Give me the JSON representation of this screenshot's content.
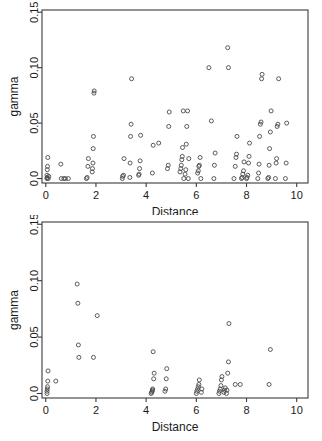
{
  "figure": {
    "title": "",
    "background": "#ffffff",
    "point_color": "#4a4a4a",
    "axis_color": "#3b3b3b"
  },
  "chart_data": [
    {
      "type": "scatter",
      "panel": "top",
      "title": "",
      "xlabel": "Distance",
      "ylabel": "gamma",
      "xlim": [
        -0.15,
        10.45
      ],
      "ylim": [
        -0.004,
        0.152
      ],
      "xticks": [
        0,
        2,
        4,
        6,
        8,
        10
      ],
      "xtick_labels": [
        "0",
        "2",
        "4",
        "6",
        "8",
        "10"
      ],
      "yticks": [
        0.0,
        0.05,
        0.1,
        0.15
      ],
      "ytick_labels": [
        "0.0",
        "0.05",
        "0.10",
        "0.15"
      ],
      "grid": false,
      "legend": null,
      "marker": "open-circle",
      "points": [
        [
          0.05,
          0.0
        ],
        [
          0.05,
          0.001
        ],
        [
          0.05,
          0.003
        ],
        [
          0.06,
          0.008
        ],
        [
          0.07,
          0.011
        ],
        [
          0.08,
          0.019
        ],
        [
          0.1,
          0.0
        ],
        [
          0.12,
          0.002
        ],
        [
          0.6,
          0.013
        ],
        [
          0.62,
          0.0
        ],
        [
          0.72,
          0.0
        ],
        [
          0.78,
          0.0
        ],
        [
          0.9,
          0.0
        ],
        [
          1.62,
          0.0
        ],
        [
          1.65,
          0.001
        ],
        [
          1.68,
          0.011
        ],
        [
          1.7,
          0.018
        ],
        [
          1.85,
          0.006
        ],
        [
          1.86,
          0.009
        ],
        [
          1.88,
          0.014
        ],
        [
          1.89,
          0.027
        ],
        [
          1.9,
          0.038
        ],
        [
          1.92,
          0.077
        ],
        [
          1.93,
          0.079
        ],
        [
          3.05,
          0.0
        ],
        [
          3.06,
          0.002
        ],
        [
          3.1,
          0.003
        ],
        [
          3.12,
          0.018
        ],
        [
          3.35,
          0.001
        ],
        [
          3.36,
          0.014
        ],
        [
          3.38,
          0.038
        ],
        [
          3.4,
          0.049
        ],
        [
          3.42,
          0.09
        ],
        [
          3.7,
          0.003
        ],
        [
          3.72,
          0.004
        ],
        [
          3.74,
          0.009
        ],
        [
          3.76,
          0.016
        ],
        [
          3.78,
          0.039
        ],
        [
          4.25,
          0.005
        ],
        [
          4.28,
          0.03
        ],
        [
          4.5,
          0.032
        ],
        [
          4.85,
          0.009
        ],
        [
          4.88,
          0.012
        ],
        [
          4.9,
          0.047
        ],
        [
          4.92,
          0.06
        ],
        [
          5.35,
          0.006
        ],
        [
          5.38,
          0.009
        ],
        [
          5.4,
          0.012
        ],
        [
          5.42,
          0.017
        ],
        [
          5.44,
          0.02
        ],
        [
          5.45,
          0.028
        ],
        [
          5.48,
          0.061
        ],
        [
          5.5,
          0.0
        ],
        [
          5.55,
          0.004
        ],
        [
          5.58,
          0.008
        ],
        [
          5.6,
          0.031
        ],
        [
          5.62,
          0.047
        ],
        [
          5.65,
          0.061
        ],
        [
          5.68,
          0.0
        ],
        [
          5.7,
          0.018
        ],
        [
          6.05,
          0.005
        ],
        [
          6.08,
          0.007
        ],
        [
          6.1,
          0.011
        ],
        [
          6.12,
          0.012
        ],
        [
          6.15,
          0.019
        ],
        [
          6.18,
          0.0
        ],
        [
          6.5,
          0.1
        ],
        [
          6.6,
          0.052
        ],
        [
          6.7,
          0.0
        ],
        [
          6.72,
          0.012
        ],
        [
          6.75,
          0.023
        ],
        [
          7.25,
          0.118
        ],
        [
          7.28,
          0.1
        ],
        [
          7.5,
          0.0
        ],
        [
          7.55,
          0.011
        ],
        [
          7.58,
          0.019
        ],
        [
          7.6,
          0.022
        ],
        [
          7.62,
          0.038
        ],
        [
          7.8,
          0.0
        ],
        [
          7.82,
          0.001
        ],
        [
          7.85,
          0.004
        ],
        [
          7.88,
          0.007
        ],
        [
          7.9,
          0.015
        ],
        [
          8.0,
          0.0
        ],
        [
          8.02,
          0.001
        ],
        [
          8.05,
          0.003
        ],
        [
          8.08,
          0.014
        ],
        [
          8.1,
          0.02
        ],
        [
          8.12,
          0.032
        ],
        [
          8.45,
          0.0
        ],
        [
          8.48,
          0.005
        ],
        [
          8.5,
          0.013
        ],
        [
          8.52,
          0.038
        ],
        [
          8.55,
          0.049
        ],
        [
          8.58,
          0.051
        ],
        [
          8.6,
          0.09
        ],
        [
          8.62,
          0.094
        ],
        [
          8.85,
          0.0
        ],
        [
          8.88,
          0.001
        ],
        [
          8.9,
          0.012
        ],
        [
          8.92,
          0.027
        ],
        [
          8.95,
          0.042
        ],
        [
          8.98,
          0.061
        ],
        [
          9.15,
          0.0
        ],
        [
          9.18,
          0.014
        ],
        [
          9.2,
          0.018
        ],
        [
          9.22,
          0.047
        ],
        [
          9.25,
          0.049
        ],
        [
          9.28,
          0.09
        ],
        [
          9.55,
          0.0
        ],
        [
          9.58,
          0.014
        ],
        [
          9.6,
          0.05
        ]
      ]
    },
    {
      "type": "scatter",
      "panel": "bottom",
      "title": "",
      "xlabel": "Distance",
      "ylabel": "gamma",
      "xlim": [
        -0.15,
        10.45
      ],
      "ylim": [
        -0.004,
        0.152
      ],
      "xticks": [
        0,
        2,
        4,
        6,
        8,
        10
      ],
      "xtick_labels": [
        "0",
        "2",
        "4",
        "6",
        "8",
        "10"
      ],
      "yticks": [
        0.0,
        0.05,
        0.1,
        0.15
      ],
      "ytick_labels": [
        "0.0",
        "0.05",
        "0.10",
        "0.15"
      ],
      "grid": false,
      "legend": null,
      "marker": "open-circle",
      "points": [
        [
          0.05,
          0.0
        ],
        [
          0.05,
          0.002
        ],
        [
          0.06,
          0.004
        ],
        [
          0.07,
          0.006
        ],
        [
          0.08,
          0.011
        ],
        [
          0.09,
          0.02
        ],
        [
          0.4,
          0.011
        ],
        [
          1.25,
          0.097
        ],
        [
          1.28,
          0.08
        ],
        [
          1.3,
          0.043
        ],
        [
          1.32,
          0.032
        ],
        [
          1.9,
          0.032
        ],
        [
          2.05,
          0.069
        ],
        [
          4.2,
          0.0
        ],
        [
          4.22,
          0.001
        ],
        [
          4.24,
          0.002
        ],
        [
          4.25,
          0.003
        ],
        [
          4.26,
          0.004
        ],
        [
          4.3,
          0.013
        ],
        [
          4.32,
          0.018
        ],
        [
          4.28,
          0.037
        ],
        [
          4.75,
          0.002
        ],
        [
          4.78,
          0.004
        ],
        [
          4.8,
          0.013
        ],
        [
          4.82,
          0.022
        ],
        [
          6.0,
          0.0
        ],
        [
          6.02,
          0.002
        ],
        [
          6.05,
          0.004
        ],
        [
          6.08,
          0.006
        ],
        [
          6.1,
          0.008
        ],
        [
          6.12,
          0.012
        ],
        [
          6.2,
          0.001
        ],
        [
          6.22,
          0.004
        ],
        [
          6.9,
          0.0
        ],
        [
          6.92,
          0.002
        ],
        [
          6.95,
          0.004
        ],
        [
          6.98,
          0.007
        ],
        [
          7.0,
          0.012
        ],
        [
          7.02,
          0.015
        ],
        [
          7.1,
          0.001
        ],
        [
          7.12,
          0.003
        ],
        [
          7.15,
          0.005
        ],
        [
          7.2,
          0.0
        ],
        [
          7.22,
          0.003
        ],
        [
          7.25,
          0.018
        ],
        [
          7.28,
          0.028
        ],
        [
          7.3,
          0.062
        ],
        [
          7.55,
          0.008
        ],
        [
          7.75,
          0.008
        ],
        [
          8.9,
          0.008
        ],
        [
          8.95,
          0.039
        ]
      ]
    }
  ]
}
